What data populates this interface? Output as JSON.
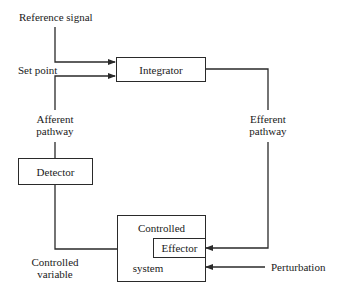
{
  "diagram": {
    "labels": {
      "reference_signal": "Reference signal",
      "set_point": "Set point",
      "afferent_pathway_line1": "Afferent",
      "afferent_pathway_line2": "pathway",
      "efferent_pathway_line1": "Efferent",
      "efferent_pathway_line2": "pathway",
      "controlled_variable_line1": "Controlled",
      "controlled_variable_line2": "variable",
      "perturbation": "Perturbation"
    },
    "blocks": {
      "integrator": "Integrator",
      "detector": "Detector",
      "controlled_system_top": "Controlled",
      "controlled_system_bottom": "system",
      "effector": "Effector"
    },
    "colors": {
      "line": "#2a2a2a",
      "background": "#ffffff"
    }
  }
}
